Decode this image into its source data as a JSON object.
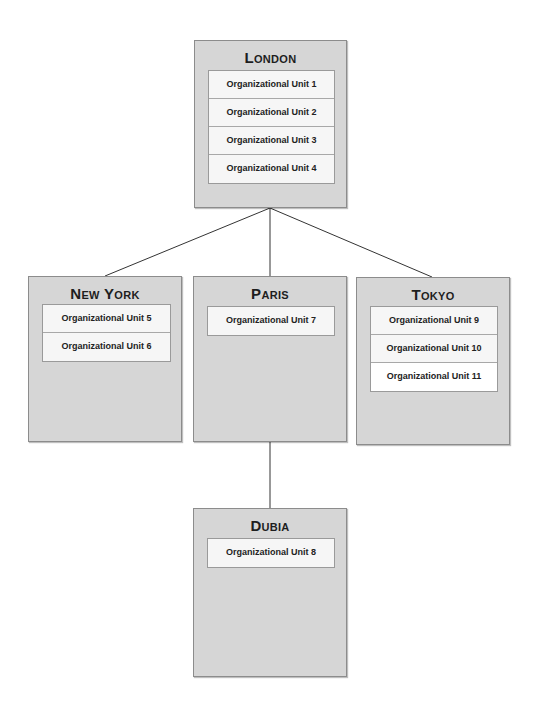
{
  "diagram": {
    "type": "org-chart",
    "offices": [
      {
        "id": "london",
        "name": "London",
        "units": [
          "Organizational Unit 1",
          "Organizational Unit 2",
          "Organizational Unit 3",
          "Organizational Unit 4"
        ]
      },
      {
        "id": "new-york",
        "name": "New York",
        "units": [
          "Organizational Unit 5",
          "Organizational Unit 6"
        ]
      },
      {
        "id": "paris",
        "name": "Paris",
        "units": [
          "Organizational Unit 7"
        ]
      },
      {
        "id": "tokyo",
        "name": "Tokyo",
        "units": [
          "Organizational Unit 9",
          "Organizational Unit 10",
          "Organizational Unit 11"
        ]
      },
      {
        "id": "dubia",
        "name": "Dubia",
        "units": [
          "Organizational Unit 8"
        ]
      }
    ],
    "links": [
      {
        "from": "london",
        "to": "new-york"
      },
      {
        "from": "london",
        "to": "paris"
      },
      {
        "from": "london",
        "to": "tokyo"
      },
      {
        "from": "paris",
        "to": "dubia"
      }
    ],
    "colors": {
      "box_fill": "#d6d6d6",
      "box_border": "#8c8c8c",
      "unit_fill": "#f6f6f6",
      "line": "#333333"
    }
  }
}
